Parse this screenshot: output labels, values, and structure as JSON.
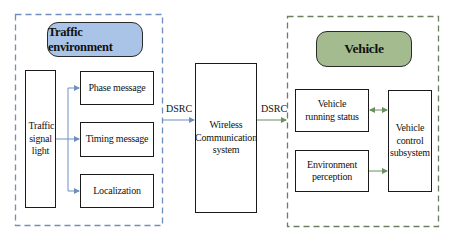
{
  "colors": {
    "traffic_group_border": "#6f8fbf",
    "traffic_pill_fill": "#a9c4e6",
    "vehicle_group_border": "#6b7f5f",
    "vehicle_pill_fill": "#a3bb8f",
    "blue_arrow": "#6f8fbf",
    "green_arrow": "#6b8f5f"
  },
  "traffic_environment": {
    "title": "Traffic environment",
    "source": "Traffic signal light",
    "messages": [
      {
        "label": "Phase message"
      },
      {
        "label": "Timing message"
      },
      {
        "label": "Localization"
      }
    ]
  },
  "link_left_label": "DSRC",
  "wireless": {
    "label": "Wireless Communication system"
  },
  "link_right_label": "DSRC",
  "vehicle": {
    "title": "Vehicle",
    "running_status": "Vehicle running status",
    "environment_perception": "Environment perception",
    "control_subsystem": "Vehicle control subsystem"
  }
}
